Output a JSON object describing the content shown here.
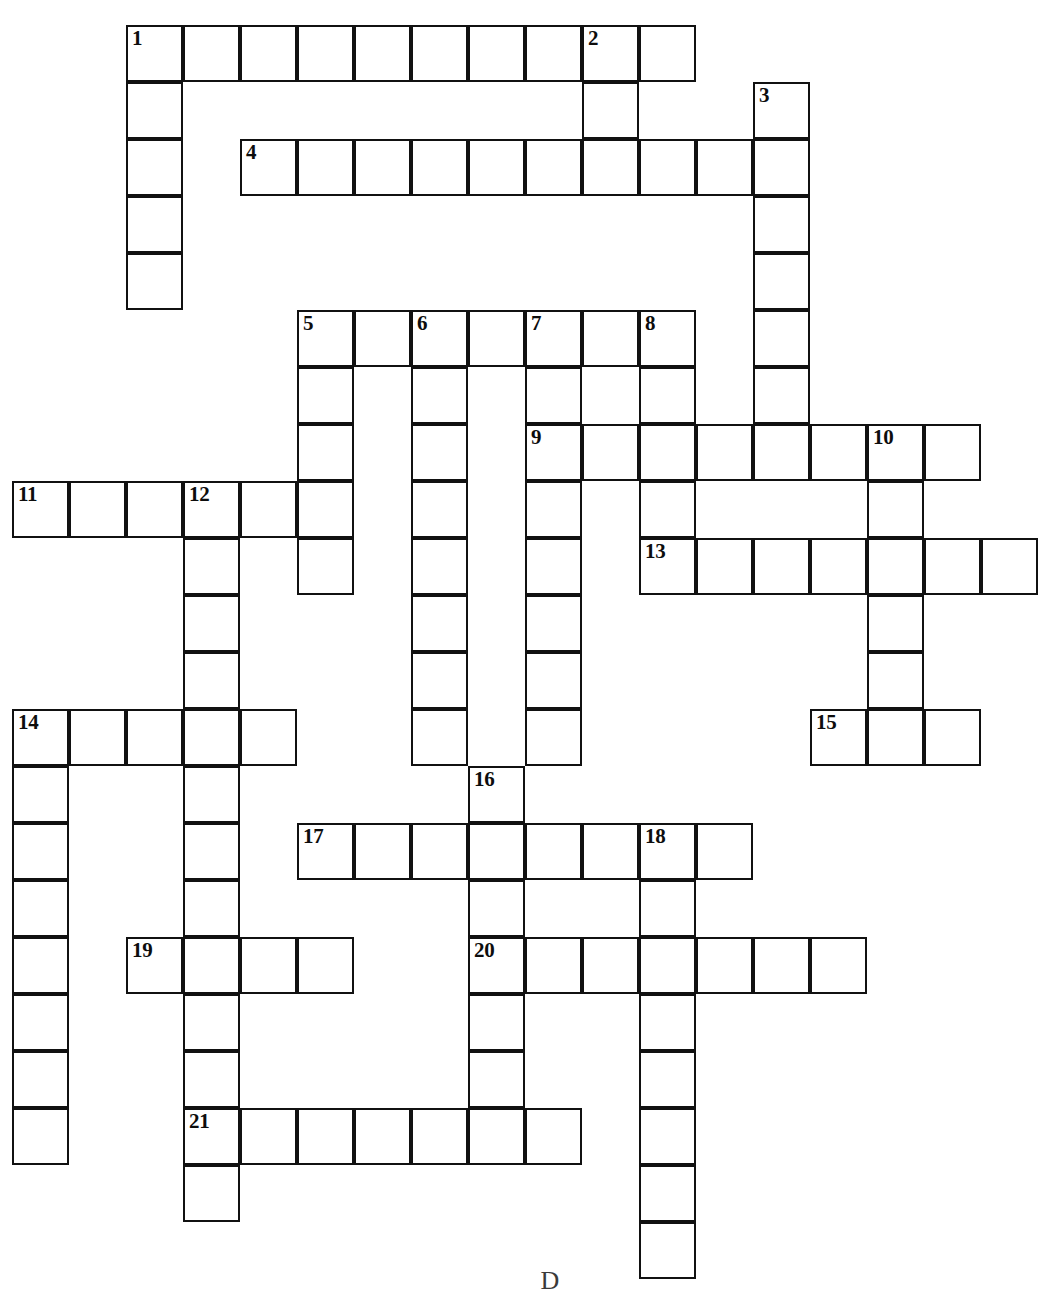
{
  "puzzle": {
    "title": "Crossword Puzzle Grid",
    "grid": {
      "cell_size": 57,
      "origin_x": 12,
      "origin_y": 25,
      "columns": 18,
      "rows": 22,
      "border_color": "#111111",
      "cell_fill": "#ffffff",
      "background": "#ffffff"
    },
    "footer_mark": "D",
    "entries": [
      {
        "number": "1",
        "direction": "across",
        "row": 0,
        "col": 2,
        "length": 10
      },
      {
        "number": "1",
        "direction": "down",
        "row": 0,
        "col": 2,
        "length": 5
      },
      {
        "number": "2",
        "direction": "down",
        "row": 0,
        "col": 10,
        "length": 3
      },
      {
        "number": "3",
        "direction": "down",
        "row": 1,
        "col": 13,
        "length": 7
      },
      {
        "number": "4",
        "direction": "across",
        "row": 2,
        "col": 4,
        "length": 10
      },
      {
        "number": "5",
        "direction": "across",
        "row": 5,
        "col": 5,
        "length": 7
      },
      {
        "number": "5",
        "direction": "down",
        "row": 5,
        "col": 5,
        "length": 5
      },
      {
        "number": "6",
        "direction": "down",
        "row": 5,
        "col": 7,
        "length": 8
      },
      {
        "number": "7",
        "direction": "down",
        "row": 5,
        "col": 9,
        "length": 8
      },
      {
        "number": "8",
        "direction": "down",
        "row": 5,
        "col": 11,
        "length": 4
      },
      {
        "number": "9",
        "direction": "across",
        "row": 7,
        "col": 9,
        "length": 8
      },
      {
        "number": "10",
        "direction": "down",
        "row": 7,
        "col": 15,
        "length": 5
      },
      {
        "number": "11",
        "direction": "across",
        "row": 8,
        "col": 0,
        "length": 6
      },
      {
        "number": "12",
        "direction": "down",
        "row": 8,
        "col": 3,
        "length": 13
      },
      {
        "number": "13",
        "direction": "across",
        "row": 9,
        "col": 11,
        "length": 7
      },
      {
        "number": "14",
        "direction": "across",
        "row": 12,
        "col": 0,
        "length": 5
      },
      {
        "number": "14",
        "direction": "down",
        "row": 12,
        "col": 0,
        "length": 8
      },
      {
        "number": "15",
        "direction": "across",
        "row": 12,
        "col": 14,
        "length": 3
      },
      {
        "number": "16",
        "direction": "down",
        "row": 13,
        "col": 8,
        "length": 7
      },
      {
        "number": "17",
        "direction": "across",
        "row": 14,
        "col": 5,
        "length": 8
      },
      {
        "number": "18",
        "direction": "down",
        "row": 14,
        "col": 11,
        "length": 8
      },
      {
        "number": "19",
        "direction": "across",
        "row": 16,
        "col": 2,
        "length": 4
      },
      {
        "number": "20",
        "direction": "across",
        "row": 16,
        "col": 8,
        "length": 7
      },
      {
        "number": "21",
        "direction": "across",
        "row": 19,
        "col": 3,
        "length": 7
      }
    ],
    "numbered_cells": [
      {
        "number": "1",
        "row": 0,
        "col": 2
      },
      {
        "number": "2",
        "row": 0,
        "col": 10
      },
      {
        "number": "3",
        "row": 1,
        "col": 13
      },
      {
        "number": "4",
        "row": 2,
        "col": 4
      },
      {
        "number": "5",
        "row": 5,
        "col": 5
      },
      {
        "number": "6",
        "row": 5,
        "col": 7
      },
      {
        "number": "7",
        "row": 5,
        "col": 9
      },
      {
        "number": "8",
        "row": 5,
        "col": 11
      },
      {
        "number": "9",
        "row": 7,
        "col": 9
      },
      {
        "number": "10",
        "row": 7,
        "col": 15
      },
      {
        "number": "11",
        "row": 8,
        "col": 0
      },
      {
        "number": "12",
        "row": 8,
        "col": 3
      },
      {
        "number": "13",
        "row": 9,
        "col": 11
      },
      {
        "number": "14",
        "row": 12,
        "col": 0
      },
      {
        "number": "15",
        "row": 12,
        "col": 14
      },
      {
        "number": "16",
        "row": 13,
        "col": 8
      },
      {
        "number": "17",
        "row": 14,
        "col": 5
      },
      {
        "number": "18",
        "row": 14,
        "col": 11
      },
      {
        "number": "19",
        "row": 16,
        "col": 2
      },
      {
        "number": "20",
        "row": 16,
        "col": 8
      },
      {
        "number": "21",
        "row": 19,
        "col": 3
      }
    ]
  }
}
